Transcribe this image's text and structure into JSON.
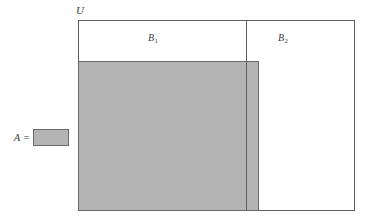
{
  "figure": {
    "type": "set-diagram",
    "background_color": "#ffffff"
  },
  "universe": {
    "label": "U",
    "border_color": "#5d5d5d",
    "fill_color": "#ffffff"
  },
  "partitions": [
    {
      "label": "B",
      "subscript": "1",
      "display": "B₁"
    },
    {
      "label": "B",
      "subscript": "2",
      "display": "B₂"
    }
  ],
  "divider": {
    "color": "#5d5d5d"
  },
  "set_a": {
    "fill_color": "#b4b4b4",
    "border_color": "#6a6a6a"
  },
  "legend": {
    "label": "A",
    "equals": "=",
    "swatch_fill": "#b4b4b4",
    "swatch_border": "#6a6a6a"
  }
}
